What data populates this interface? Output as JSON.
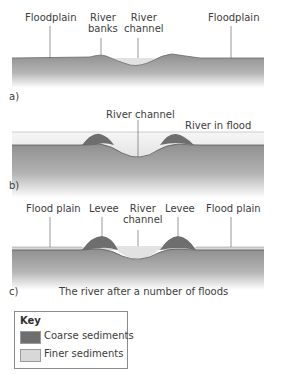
{
  "diagram": {
    "panels": [
      {
        "id": "a)",
        "labels": {
          "floodplain_left": "Floodplain",
          "river_banks": "River\nbanks",
          "river_channel": "River\nchannel",
          "floodplain_right": "Floodplain"
        }
      },
      {
        "id": "b)",
        "labels": {
          "river_channel": "River channel",
          "river_in_flood": "River in flood"
        }
      },
      {
        "id": "c)",
        "caption": "The river after a number of floods",
        "labels": {
          "flood_plain_left": "Flood plain",
          "levee_left": "Levee",
          "river_channel": "River\nchannel",
          "levee_right": "Levee",
          "flood_plain_right": "Flood plain"
        }
      }
    ],
    "key": {
      "title": "Key",
      "items": [
        {
          "label": "Coarse sediments",
          "color": "#6e6e6e"
        },
        {
          "label": "Finer sediments",
          "color": "#d8d8d8"
        }
      ]
    },
    "colors": {
      "ground_top": "#8f8f8f",
      "ground_bottom": "#ffffff",
      "water": "#e2e2e2",
      "flood_water": "#e8e8e8",
      "leader_line": "#555555"
    }
  }
}
